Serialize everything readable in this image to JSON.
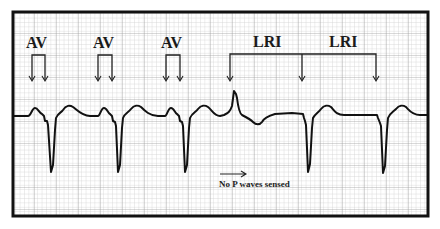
{
  "figure": {
    "frame": {
      "x": 12,
      "y": 11,
      "width": 417,
      "height": 206
    },
    "colors": {
      "background": "#ffffff",
      "grid_minor": "#c8c8c8",
      "grid_major": "#9a9a9a",
      "trace": "#111111",
      "frame": "#111111"
    }
  },
  "annotations": {
    "av_labels": [
      {
        "text": "AV",
        "x": 38,
        "bracket_left": 31,
        "bracket_right": 45
      },
      {
        "text": "AV",
        "x": 104,
        "bracket_left": 97,
        "bracket_right": 112
      },
      {
        "text": "AV",
        "x": 172,
        "bracket_left": 165,
        "bracket_right": 180
      }
    ],
    "lri_labels": [
      {
        "text": "LRI",
        "x": 266
      },
      {
        "text": "LRI",
        "x": 340
      }
    ],
    "lri_bracket": {
      "left": 230,
      "middle": 302,
      "right": 376,
      "y": 54
    },
    "note": {
      "text": "No P waves sensed",
      "arrow_from": 239,
      "arrow_to": 246
    }
  },
  "labels": {
    "av1": "AV",
    "av2": "AV",
    "av3": "AV",
    "lri1": "LRI",
    "lri2": "LRI",
    "note": "No P waves sensed"
  }
}
